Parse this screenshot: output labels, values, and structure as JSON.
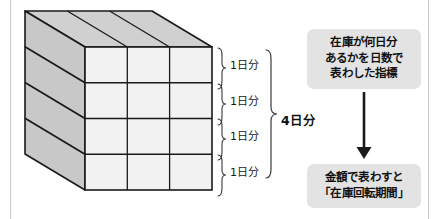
{
  "diagram": {
    "title_hidden": "",
    "cube": {
      "description_label": "inventory-stack-cube",
      "rows": 4,
      "columns": 3,
      "front_face_color": "#f2f2f2",
      "side_face_color": "#c8c8c8",
      "top_face_color": "#d0d0d0",
      "outline_color": "#1a1a1a"
    },
    "row_labels": [
      "1日分",
      "1日分",
      "1日分",
      "1日分"
    ],
    "total_label": "4日分",
    "callouts": {
      "definition": "在庫が何日分\nあるかを日数で\n表わした指標",
      "term": "金額で表わすと\n「在庫回転期間」"
    },
    "arrow": {
      "direction": "down",
      "color": "#1a1a1a"
    },
    "colors": {
      "page_background": "#ffffff",
      "rule": "#c9c9c9",
      "callout_background": "#e3e3e3",
      "text": "#111111"
    }
  }
}
